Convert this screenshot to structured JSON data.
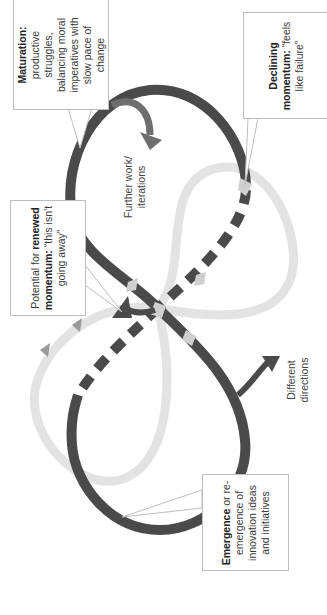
{
  "diagram": {
    "type": "figure-eight cycle of innovation momentum",
    "orientation": "rotated 90 degrees counter-clockwise",
    "colors": {
      "dark_loop": "#4a4a4a",
      "light_loop": "#e3e3e3",
      "light_arrow": "#c8c8c8",
      "mid_arrow": "#9a9a9a",
      "box_border": "#bdbdbd"
    },
    "callouts": {
      "maturation": {
        "bold": "Maturation:",
        "lines": [
          "productive",
          "struggles,",
          "balancing moral",
          "imperatives with",
          "slow pace of",
          "change"
        ]
      },
      "declining": {
        "bold_lines": [
          "Declining",
          "momentum:"
        ],
        "rest": "“feels",
        "last": "like failure”"
      },
      "potential": {
        "prefix": "Potential for",
        "bold1": "renewed",
        "bold2": "momentum:",
        "rest": "“this isn’t",
        "last": "going away”"
      },
      "emergence": {
        "bold": "Emergence",
        "rest": "or re-",
        "lines": [
          "emergence of",
          "innovation ideas",
          "and initiatives"
        ]
      }
    },
    "labels": {
      "further_work_1": "Further work/",
      "further_work_2": "iterations",
      "different_1": "Different",
      "different_2": "directions"
    }
  }
}
